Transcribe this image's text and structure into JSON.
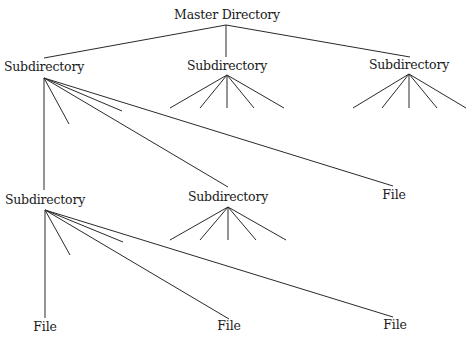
{
  "diagram": {
    "title": "Master Directory",
    "type": "tree",
    "line_color": "#2a2a2a",
    "nodes": [
      {
        "id": "master",
        "label": "Master Directory",
        "x": 227,
        "y": 9
      },
      {
        "id": "sub_top_left",
        "label": "Subdirectory",
        "x": 44,
        "y": 61
      },
      {
        "id": "sub_top_mid",
        "label": "Subdirectory",
        "x": 227,
        "y": 60
      },
      {
        "id": "sub_top_right",
        "label": "Subdirectory",
        "x": 409,
        "y": 59
      },
      {
        "id": "sub_bot_left",
        "label": "Subdirectory",
        "x": 45,
        "y": 194
      },
      {
        "id": "sub_bot_mid",
        "label": "Subdirectory",
        "x": 228,
        "y": 191
      },
      {
        "id": "file_mid_right",
        "label": "File",
        "x": 394,
        "y": 189
      },
      {
        "id": "file_bot_left",
        "label": "File",
        "x": 45,
        "y": 321
      },
      {
        "id": "file_bot_mid",
        "label": "File",
        "x": 229,
        "y": 320
      },
      {
        "id": "file_bot_right",
        "label": "File",
        "x": 395,
        "y": 319
      }
    ],
    "edges": [
      {
        "from": "master",
        "x1": 226,
        "y1": 25,
        "x2": 44,
        "y2": 58
      },
      {
        "from": "master",
        "x1": 226,
        "y1": 25,
        "x2": 226,
        "y2": 57
      },
      {
        "from": "master",
        "x1": 226,
        "y1": 25,
        "x2": 410,
        "y2": 57
      },
      {
        "from": "sub_top_left",
        "x1": 44,
        "y1": 78,
        "x2": 44,
        "y2": 190
      },
      {
        "from": "sub_top_left",
        "x1": 44,
        "y1": 78,
        "x2": 69,
        "y2": 124
      },
      {
        "from": "sub_top_left",
        "x1": 44,
        "y1": 78,
        "x2": 122,
        "y2": 111
      },
      {
        "from": "sub_top_left",
        "x1": 44,
        "y1": 78,
        "x2": 228,
        "y2": 187
      },
      {
        "from": "sub_top_left",
        "x1": 44,
        "y1": 78,
        "x2": 393,
        "y2": 186
      },
      {
        "from": "sub_top_mid",
        "x1": 227,
        "y1": 75,
        "x2": 170,
        "y2": 108
      },
      {
        "from": "sub_top_mid",
        "x1": 227,
        "y1": 75,
        "x2": 200,
        "y2": 108
      },
      {
        "from": "sub_top_mid",
        "x1": 227,
        "y1": 75,
        "x2": 227,
        "y2": 108
      },
      {
        "from": "sub_top_mid",
        "x1": 227,
        "y1": 75,
        "x2": 254,
        "y2": 108
      },
      {
        "from": "sub_top_mid",
        "x1": 227,
        "y1": 75,
        "x2": 284,
        "y2": 108
      },
      {
        "from": "sub_top_right",
        "x1": 409,
        "y1": 74,
        "x2": 353,
        "y2": 108
      },
      {
        "from": "sub_top_right",
        "x1": 409,
        "y1": 74,
        "x2": 382,
        "y2": 108
      },
      {
        "from": "sub_top_right",
        "x1": 409,
        "y1": 74,
        "x2": 409,
        "y2": 108
      },
      {
        "from": "sub_top_right",
        "x1": 409,
        "y1": 74,
        "x2": 437,
        "y2": 108
      },
      {
        "from": "sub_top_right",
        "x1": 409,
        "y1": 74,
        "x2": 466,
        "y2": 108
      },
      {
        "from": "sub_bot_left",
        "x1": 45,
        "y1": 210,
        "x2": 45,
        "y2": 318
      },
      {
        "from": "sub_bot_left",
        "x1": 45,
        "y1": 210,
        "x2": 70,
        "y2": 255
      },
      {
        "from": "sub_bot_left",
        "x1": 45,
        "y1": 210,
        "x2": 123,
        "y2": 242
      },
      {
        "from": "sub_bot_left",
        "x1": 45,
        "y1": 210,
        "x2": 229,
        "y2": 319
      },
      {
        "from": "sub_bot_left",
        "x1": 45,
        "y1": 210,
        "x2": 393,
        "y2": 317
      },
      {
        "from": "sub_bot_mid",
        "x1": 228,
        "y1": 207,
        "x2": 170,
        "y2": 240
      },
      {
        "from": "sub_bot_mid",
        "x1": 228,
        "y1": 207,
        "x2": 200,
        "y2": 240
      },
      {
        "from": "sub_bot_mid",
        "x1": 228,
        "y1": 207,
        "x2": 228,
        "y2": 240
      },
      {
        "from": "sub_bot_mid",
        "x1": 228,
        "y1": 207,
        "x2": 256,
        "y2": 240
      },
      {
        "from": "sub_bot_mid",
        "x1": 228,
        "y1": 207,
        "x2": 286,
        "y2": 240
      }
    ]
  }
}
